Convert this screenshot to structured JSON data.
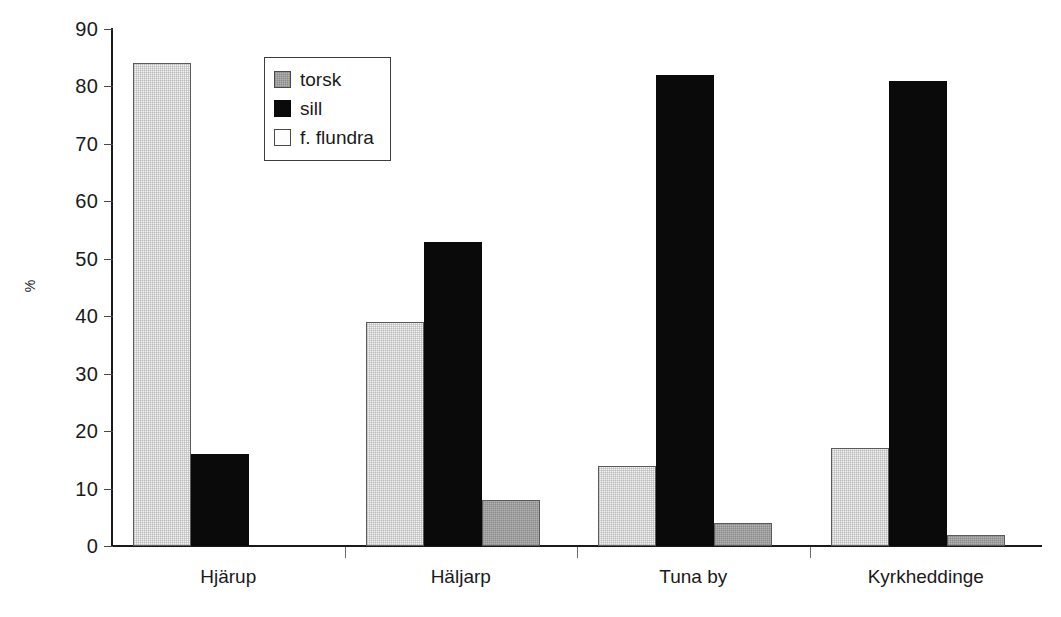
{
  "chart_data": {
    "type": "bar",
    "title": "",
    "subtitle": "",
    "xlabel": "",
    "ylabel": "%",
    "ylim": [
      0,
      90
    ],
    "ytick_step": 10,
    "yticks": [
      90,
      80,
      70,
      60,
      50,
      40,
      30,
      20,
      10,
      0
    ],
    "grid": false,
    "legend_position": "inside-top-left",
    "categories": [
      "Hjärup",
      "Häljarp",
      "Tuna by",
      "Kyrkheddinge"
    ],
    "series": [
      {
        "name": "f. flundra",
        "color": "#f2f2f2",
        "values": [
          84,
          39,
          14,
          17
        ]
      },
      {
        "name": "sill",
        "color": "#0a0a0a",
        "values": [
          16,
          53,
          82,
          81
        ]
      },
      {
        "name": "torsk",
        "color": "#b4b4b4",
        "values": [
          0,
          8,
          4,
          2
        ]
      }
    ],
    "legend_order": [
      "torsk",
      "sill",
      "f. flundra"
    ],
    "bar_draw_order": [
      "f. flundra",
      "sill",
      "torsk"
    ]
  },
  "legend": {
    "items": [
      {
        "label": "torsk",
        "swatch": "gray-swatch-icon"
      },
      {
        "label": "sill",
        "swatch": "black-swatch-icon"
      },
      {
        "label": "f. flundra",
        "swatch": "white-swatch-icon"
      }
    ]
  },
  "axis": {
    "y_title": "%",
    "y_labels": [
      "90",
      "80",
      "70",
      "60",
      "50",
      "40",
      "30",
      "20",
      "10",
      "0"
    ],
    "x_labels": [
      "Hjärup",
      "Häljarp",
      "Tuna by",
      "Kyrkheddinge"
    ]
  }
}
